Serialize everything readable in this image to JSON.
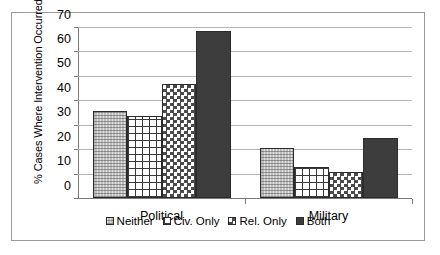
{
  "chart_data": {
    "type": "bar",
    "title": "",
    "xlabel": "",
    "ylabel": "% Cases Where Intervention Occurred",
    "categories": [
      "Political",
      "Military"
    ],
    "ylim": [
      0,
      70
    ],
    "yticks": [
      0,
      10,
      20,
      30,
      40,
      50,
      60,
      70
    ],
    "ytick_labels": [
      "0",
      "10",
      "20",
      "30",
      "40",
      "50",
      "60",
      "70"
    ],
    "grid": true,
    "legend_position": "bottom",
    "series": [
      {
        "name": "Neither",
        "pattern": "light-stipple",
        "values": [
          35.5,
          20.5
        ]
      },
      {
        "name": "Civ. Only",
        "pattern": "grid-lines",
        "values": [
          33.5,
          12.5
        ]
      },
      {
        "name": "Rel. Only",
        "pattern": "checkerboard",
        "values": [
          46.5,
          10.5
        ]
      },
      {
        "name": "Both",
        "pattern": "solid-dark",
        "values": [
          68.5,
          24.5
        ]
      }
    ]
  },
  "colors": {
    "frame_border": "#9a9a9a",
    "gridline": "#b4b4b4",
    "axis": "#7a7a7a",
    "bar_outline": "#2b2b2b",
    "neither_fill": "#e3e3e3",
    "civ_fill": "#ffffff",
    "rel_fill": "#ffffff",
    "both_fill": "#3d3d3d",
    "text": "#000000"
  }
}
